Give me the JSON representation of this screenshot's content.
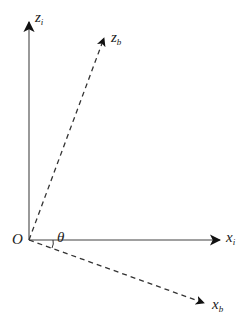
{
  "diagram": {
    "title": "",
    "origin": {
      "label": "O"
    },
    "angle": {
      "label": "θ"
    },
    "axes": [
      {
        "id": "z_i",
        "base": "z",
        "sub": "i",
        "style": "solid"
      },
      {
        "id": "z_b",
        "base": "z",
        "sub": "b",
        "style": "dashed"
      },
      {
        "id": "x_i",
        "base": "x",
        "sub": "i",
        "style": "solid"
      },
      {
        "id": "x_b",
        "base": "x",
        "sub": "b",
        "style": "dashed"
      }
    ],
    "colors": {
      "solid_axis": "#808080",
      "dashed_axis": "#333333",
      "arrowhead": "#111111",
      "text": "#222222"
    }
  }
}
